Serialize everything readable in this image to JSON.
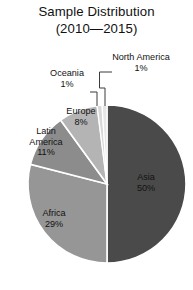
{
  "chart_data": {
    "type": "pie",
    "title": "Sample Distribution (2010—2015)",
    "title_line1": "Sample Distribution",
    "title_line2": "(2010—2015)",
    "xlabel": "",
    "ylabel": "",
    "legend": "none",
    "grid": false,
    "value_suffix": "%",
    "categories": [
      "Asia",
      "Africa",
      "Latin America",
      "Europe",
      "Oceania",
      "North America"
    ],
    "values": [
      50,
      29,
      11,
      8,
      1,
      1
    ],
    "series": [
      {
        "name": "Share of sample",
        "values": [
          50,
          29,
          11,
          8,
          1,
          1
        ]
      }
    ],
    "slices": [
      {
        "label": "Asia",
        "value": 50,
        "value_text": "50%",
        "color": "#4a4a4a",
        "label_placement": "inside"
      },
      {
        "label": "Africa",
        "value": 29,
        "value_text": "29%",
        "color": "#969696",
        "label_placement": "inside"
      },
      {
        "label": "Latin America",
        "value": 11,
        "value_text": "11%",
        "color": "#8c8c8c",
        "label_placement": "inside"
      },
      {
        "label": "Europe",
        "value": 8,
        "value_text": "8%",
        "color": "#b4b4b4",
        "label_placement": "inside"
      },
      {
        "label": "Oceania",
        "value": 1,
        "value_text": "1%",
        "color": "#d8d8d8",
        "label_placement": "outside-leader"
      },
      {
        "label": "North America",
        "value": 1,
        "value_text": "1%",
        "color": "#e6e6e6",
        "label_placement": "outside-leader"
      }
    ],
    "start_angle_deg": 0,
    "direction": "clockwise",
    "background": "#ffffff",
    "slice_border_color": "#ffffff"
  },
  "labels": {
    "asia_name": "Asia",
    "asia_pct": "50%",
    "africa_name": "Africa",
    "africa_pct": "29%",
    "latin_name_1": "Latin",
    "latin_name_2": "America",
    "latin_pct": "11%",
    "europe_name": "Europe",
    "europe_pct": "8%",
    "oceania_name": "Oceania",
    "oceania_pct": "1%",
    "north_america_name": "North America",
    "north_america_pct": "1%"
  }
}
